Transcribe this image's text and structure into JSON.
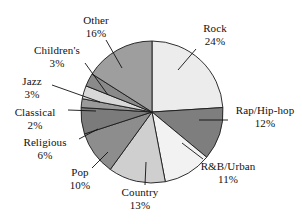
{
  "chart_data": {
    "type": "pie",
    "title": "",
    "subtitle": "",
    "xlabel": "",
    "ylabel": "",
    "legend_position": "none",
    "grid": false,
    "start_angle_deg": 0,
    "direction": "clockwise",
    "units": "percent",
    "categories": [
      "Rock",
      "Rap/Hip-hop",
      "R&B/Urban",
      "Country",
      "Pop",
      "Religious",
      "Classical",
      "Jazz",
      "Children's",
      "Other"
    ],
    "values": [
      24,
      12,
      11,
      13,
      10,
      6,
      2,
      3,
      3,
      16
    ],
    "slices": [
      {
        "label": "Rock",
        "value": 24,
        "value_text": "24%",
        "color": "#ececec"
      },
      {
        "label": "Rap/Hip-hop",
        "value": 12,
        "value_text": "12%",
        "color": "#7e7e7e"
      },
      {
        "label": "R&B/Urban",
        "value": 11,
        "value_text": "11%",
        "color": "#f2f2f2"
      },
      {
        "label": "Country",
        "value": 13,
        "value_text": "13%",
        "color": "#cfcfcf"
      },
      {
        "label": "Pop",
        "value": 10,
        "value_text": "10%",
        "color": "#8d8d8d"
      },
      {
        "label": "Religious",
        "value": 6,
        "value_text": "6%",
        "color": "#7b7b7b"
      },
      {
        "label": "Classical",
        "value": 2,
        "value_text": "2%",
        "color": "#9a9a9a"
      },
      {
        "label": "Jazz",
        "value": 3,
        "value_text": "3%",
        "color": "#d8d8d8"
      },
      {
        "label": "Children's",
        "value": 3,
        "value_text": "3%",
        "color": "#8a8a8a"
      },
      {
        "label": "Other",
        "value": 16,
        "value_text": "16%",
        "color": "#9e9e9e"
      }
    ],
    "geometry": {
      "center_x": 152,
      "center_y": 112,
      "radius": 71,
      "stroke_color": "#1a1a1a",
      "stroke_width": 0.9,
      "background": "#ffffff"
    },
    "leader_lines": [
      {
        "label": "Rock",
        "x1": 196,
        "y1": 49,
        "x2": 178,
        "y2": 70
      },
      {
        "label": "Rap/Hip-hop",
        "x1": 228,
        "y1": 120,
        "x2": 199,
        "y2": 120
      },
      {
        "label": "R&B/Urban",
        "x1": 203,
        "y1": 159,
        "x2": 182,
        "y2": 143
      },
      {
        "label": "Country",
        "x1": 145,
        "y1": 185,
        "x2": 146,
        "y2": 162
      },
      {
        "label": "Pop",
        "x1": 92,
        "y1": 168,
        "x2": 108,
        "y2": 152
      },
      {
        "label": "Religious",
        "x1": 79,
        "y1": 139,
        "x2": 98,
        "y2": 129
      },
      {
        "label": "Classical",
        "x1": 68,
        "y1": 110,
        "x2": 96,
        "y2": 111
      },
      {
        "label": "Jazz",
        "x1": 52,
        "y1": 85,
        "x2": 100,
        "y2": 102
      },
      {
        "label": "Children's",
        "x1": 85,
        "y1": 63,
        "x2": 108,
        "y2": 95
      },
      {
        "label": "Other",
        "x1": 106,
        "y1": 40,
        "x2": 122,
        "y2": 68
      }
    ]
  },
  "labels": {
    "other": {
      "name": "Other",
      "value": "16%"
    },
    "rock": {
      "name": "Rock",
      "value": "24%"
    },
    "children": {
      "name": "Children's",
      "value": "3%"
    },
    "jazz": {
      "name": "Jazz",
      "value": "3%"
    },
    "classical": {
      "name": "Classical",
      "value": "2%"
    },
    "religious": {
      "name": "Religious",
      "value": "6%"
    },
    "pop": {
      "name": "Pop",
      "value": "10%"
    },
    "country": {
      "name": "Country",
      "value": "13%"
    },
    "rnb": {
      "name": "R&B/Urban",
      "value": "11%"
    },
    "rap": {
      "name": "Rap/Hip-hop",
      "value": "12%"
    }
  }
}
